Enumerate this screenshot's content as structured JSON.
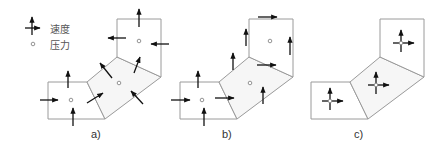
{
  "legend": {
    "velocity_label": "速度",
    "pressure_label": "压力",
    "velocity_icon": "velocity-arrows-icon",
    "pressure_icon": "pressure-circle-icon"
  },
  "panels": [
    {
      "id": "a",
      "label": "a)",
      "description": "staggered grid: velocities on cell faces, normal to faces"
    },
    {
      "id": "b",
      "label": "b)",
      "description": "staggered grid: Cartesian velocity components on faces"
    },
    {
      "id": "c",
      "label": "c)",
      "description": "collocated grid: velocity and pressure at cell centers"
    }
  ],
  "colors": {
    "cell_edge": "#9a9a9a",
    "arrow": "#111111",
    "background": "#ffffff"
  }
}
